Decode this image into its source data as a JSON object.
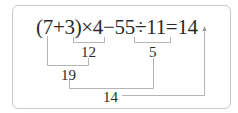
{
  "equation": {
    "text": "(7+3)×4−55÷11=14",
    "parts": [
      "(7+3)",
      "×",
      "4",
      "−",
      "55",
      "÷",
      "11",
      "=",
      "14"
    ]
  },
  "steps": [
    {
      "id": "step1",
      "expression": "(7+3)×4 partial",
      "label": "12"
    },
    {
      "id": "step2",
      "expression": "55÷11",
      "label": "5"
    },
    {
      "id": "step3",
      "expression": "7 + 12",
      "label": "19"
    },
    {
      "id": "step4",
      "expression": "19 − 5",
      "label": "14"
    }
  ],
  "result": "14",
  "colors": {
    "text": "#2a2a2a",
    "lines": "#b5b5b5",
    "frame": "#c9c9c9"
  }
}
